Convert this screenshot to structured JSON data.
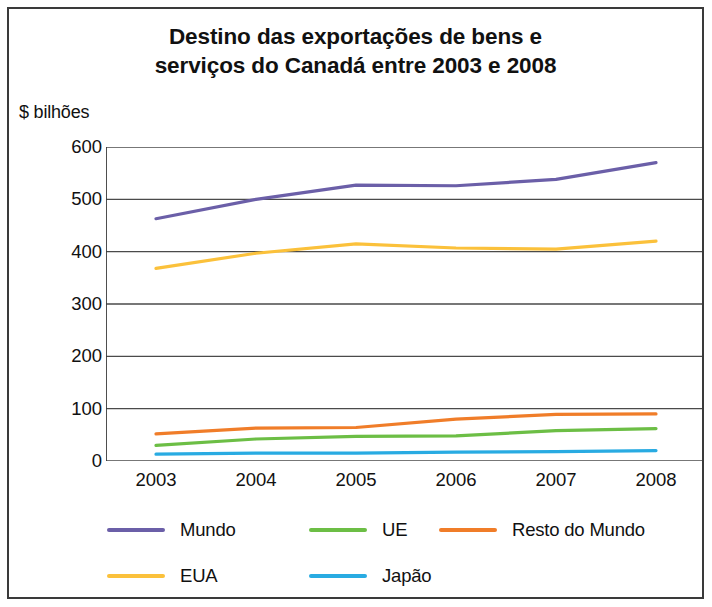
{
  "chart_data": {
    "type": "line",
    "title": "Destino das exportações de bens e serviços do Canadá entre 2003 e 2008",
    "title_line1": "Destino das exportações de bens e",
    "title_line2": "serviços do Canadá entre 2003 e 2008",
    "ylabel": "$ bilhões",
    "xlabel": "",
    "categories": [
      "2003",
      "2004",
      "2005",
      "2006",
      "2007",
      "2008"
    ],
    "x": [
      2003,
      2004,
      2005,
      2006,
      2007,
      2008
    ],
    "ylim": [
      0,
      600
    ],
    "yticks": [
      0,
      100,
      200,
      300,
      400,
      500,
      600
    ],
    "ytick_labels": [
      "0",
      "100",
      "200",
      "300",
      "400",
      "500",
      "600"
    ],
    "grid": true,
    "legend_position": "bottom",
    "series": [
      {
        "name": "Mundo",
        "color": "#6B5FA8",
        "values": [
          463,
          500,
          527,
          526,
          538,
          570
        ]
      },
      {
        "name": "UE",
        "color": "#6CBE45",
        "values": [
          30,
          42,
          47,
          48,
          58,
          62
        ]
      },
      {
        "name": "Resto do Mundo",
        "color": "#F07D29",
        "values": [
          52,
          63,
          64,
          80,
          89,
          90
        ]
      },
      {
        "name": "EUA",
        "color": "#FBC13B",
        "values": [
          368,
          397,
          415,
          407,
          405,
          420
        ]
      },
      {
        "name": "Japão",
        "color": "#29ABE2",
        "values": [
          13,
          15,
          15,
          17,
          18,
          20
        ]
      }
    ]
  },
  "legend": {
    "items": [
      {
        "label": "Mundo",
        "color": "#6B5FA8"
      },
      {
        "label": "UE",
        "color": "#6CBE45"
      },
      {
        "label": "Resto do Mundo",
        "color": "#F07D29"
      },
      {
        "label": "EUA",
        "color": "#FBC13B"
      },
      {
        "label": "Japão",
        "color": "#29ABE2"
      }
    ]
  },
  "colors": {
    "axis": "#3a3a3a",
    "grid": "#4a4a4a",
    "text": "#111111",
    "background": "#ffffff",
    "mundo": "#6B5FA8",
    "ue": "#6CBE45",
    "resto_do_mundo": "#F07D29",
    "eua": "#FBC13B",
    "japao": "#29ABE2"
  }
}
